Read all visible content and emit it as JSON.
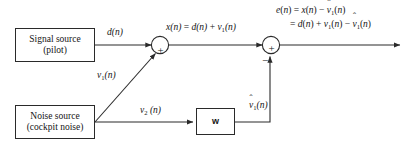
{
  "diagram": {
    "line_color": "#2a2a2a",
    "text_color": "#151515",
    "background": "#ffffff"
  },
  "blocks": {
    "signal_source": {
      "name": "signal-source-block",
      "line1": "Signal source",
      "line2": "(pilot)"
    },
    "noise_source": {
      "name": "noise-source-block",
      "line1": "Noise source",
      "line2": "(cockpit noise)"
    },
    "filter": {
      "name": "adaptive-filter-block",
      "label": "w"
    }
  },
  "summers": {
    "first": {
      "name": "summing-junction-1",
      "plus": "+"
    },
    "second": {
      "name": "summing-junction-2",
      "plus": "+",
      "minus": "−"
    }
  },
  "signal_labels": {
    "desired": {
      "var": "d",
      "arg": "(n)",
      "sub": ""
    },
    "noise_primary": {
      "var": "v",
      "sub": "1",
      "arg": "(n)"
    },
    "noise_reference": {
      "var": "v",
      "sub": "2",
      "arg": "(n)"
    },
    "noise_estimate": {
      "var": "v",
      "sub": "1",
      "arg": "(n)"
    }
  },
  "equations": {
    "x_line": {
      "lhs": "x(n)",
      "rhs": "= d(n) + v₁(n)"
    },
    "e_line1": {
      "text": "e(n) = x(n) − v̂₁(n)"
    },
    "e_line2": {
      "text": "= d(n) + v₁(n) − v̂₁(n)"
    }
  }
}
